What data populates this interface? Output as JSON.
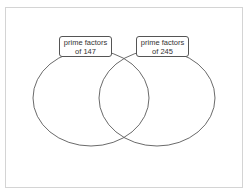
{
  "diagram": {
    "type": "venn",
    "sets": [
      {
        "label_line1": "prime factors",
        "label_line2": "of 147"
      },
      {
        "label_line1": "prime factors",
        "label_line2": "of 245"
      }
    ]
  }
}
